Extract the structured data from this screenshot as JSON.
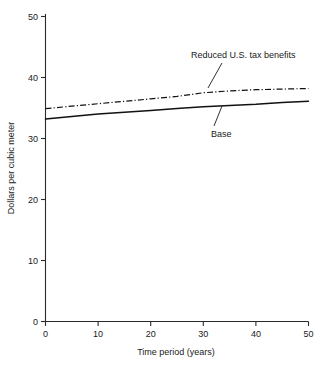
{
  "chart_data": {
    "type": "line",
    "title": "",
    "xlabel": "Time period (years)",
    "ylabel": "Dollars per cubic meter",
    "xlim": [
      0,
      50
    ],
    "ylim": [
      0,
      50
    ],
    "xticks": [
      0,
      10,
      20,
      30,
      40,
      50
    ],
    "xticklabels": [
      "0",
      "10",
      "20",
      "30",
      "40",
      "50"
    ],
    "yticks": [
      0,
      10,
      20,
      30,
      40,
      50
    ],
    "yticklabels": [
      "0",
      "10",
      "20",
      "30",
      "40",
      "50"
    ],
    "grid": false,
    "legend_position": "inline-annotations",
    "x": [
      0,
      5,
      10,
      15,
      20,
      25,
      30,
      35,
      40,
      45,
      50
    ],
    "series": [
      {
        "name": "Reduced U.S. tax benefits",
        "style": "dash-dot",
        "color": "#111111",
        "values": [
          34.9,
          35.3,
          35.7,
          36.1,
          36.5,
          36.9,
          37.5,
          37.8,
          38.0,
          38.1,
          38.2
        ]
      },
      {
        "name": "Base",
        "style": "solid",
        "color": "#111111",
        "values": [
          33.2,
          33.6,
          34.0,
          34.3,
          34.6,
          34.9,
          35.2,
          35.4,
          35.6,
          35.9,
          36.1
        ]
      }
    ],
    "annotations": [
      {
        "text": "Reduced U.S. tax benefits",
        "target_series": "Reduced U.S. tax benefits",
        "label_x": 28,
        "label_y": 44.5
      },
      {
        "text": "Base",
        "target_series": "Base",
        "label_x": 31,
        "label_y": 30.5
      }
    ]
  },
  "axis": {
    "y_title": "Dollars per cubic meter",
    "x_title": "Time period (years)",
    "y_tick_0": "0",
    "y_tick_10": "10",
    "y_tick_20": "20",
    "y_tick_30": "30",
    "y_tick_40": "40",
    "y_tick_50": "50",
    "x_tick_0": "0",
    "x_tick_10": "10",
    "x_tick_20": "20",
    "x_tick_30": "30",
    "x_tick_40": "40",
    "x_tick_50": "50"
  },
  "labels": {
    "reduced_tax": "Reduced U.S. tax benefits",
    "base": "Base"
  }
}
